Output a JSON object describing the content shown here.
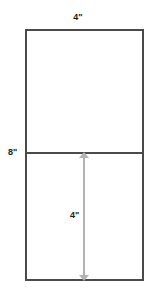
{
  "diagram": {
    "type": "geometry-rectangle-split",
    "shape": {
      "name": "rectangle",
      "width_label": "4\"",
      "height_label": "8\"",
      "divided_into": 2,
      "orientation": "portrait"
    },
    "labels": {
      "top_width": "4\"",
      "left_height": "8\"",
      "inner_segment": "4\""
    },
    "colors": {
      "outline": "#4a4a4a",
      "dimension_line": "#b3b3b3",
      "label_text": "#1a1a1a",
      "background": "#ffffff"
    }
  }
}
